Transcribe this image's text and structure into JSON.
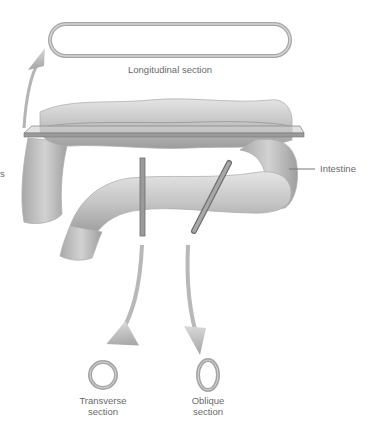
{
  "diagram": {
    "type": "sections-of-tubular-structure",
    "subject": "intestine",
    "labels": {
      "longitudinal": "Longitudinal section",
      "intestine": "Intestine",
      "transverse_line1": "Transverse",
      "transverse_line2": "section",
      "oblique_line1": "Oblique",
      "oblique_line2": "section",
      "cut_off_left": "s"
    },
    "colors": {
      "tube_fill": "#c8c8c8",
      "tube_shadow": "#9a9a9a",
      "arrow": "#b4b4b4",
      "plane": "#8f8f8f",
      "text": "#6a6a6a",
      "ring": "#a8a8a8"
    }
  }
}
